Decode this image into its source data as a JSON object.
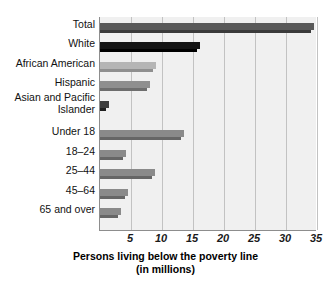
{
  "chart_data": {
    "type": "bar",
    "orientation": "horizontal",
    "title": "",
    "xlabel": "Persons living below the poverty line (in millions)",
    "ylabel": "",
    "xlim": [
      0,
      35
    ],
    "grid": true,
    "legend": false,
    "categories": [
      "Total",
      "White",
      "African American",
      "Hispanic",
      "Asian and Pacific Islander",
      "Under 18",
      "18–24",
      "25–44",
      "45–64",
      "65 and over"
    ],
    "values": [
      34.5,
      16.2,
      9.1,
      8.0,
      1.4,
      13.5,
      4.2,
      8.8,
      4.5,
      3.4
    ],
    "xticks": [
      5,
      10,
      15,
      20,
      25,
      30,
      35
    ],
    "xticklabels": [
      "5",
      "10",
      "15",
      "20",
      "25",
      "30",
      "35"
    ]
  },
  "axis_title": {
    "line1": "Persons living below the poverty line",
    "line2": "(in millions)"
  },
  "bars": [
    {
      "label": "Total",
      "value": 34.5,
      "fill": "#595959",
      "shadow": "#3a3a3a",
      "top": 6
    },
    {
      "label": "White",
      "value": 16.2,
      "fill": "#141414",
      "shadow": "#000000",
      "top": 25
    },
    {
      "label": "African American",
      "value": 9.1,
      "fill": "#b5b5b5",
      "shadow": "#8f8f8f",
      "top": 45
    },
    {
      "label": "Hispanic",
      "value": 8.0,
      "fill": "#8f8f8f",
      "shadow": "#6e6e6e",
      "top": 64
    },
    {
      "label": "Asian and Pacific\nIslander",
      "value": 1.4,
      "fill": "#3d3d3d",
      "shadow": "#1f1f1f",
      "top": 84
    },
    {
      "label": "Under 18",
      "value": 13.5,
      "fill": "#8a8a8a",
      "shadow": "#666666",
      "top": 113
    },
    {
      "label": "18–24",
      "value": 4.2,
      "fill": "#8a8a8a",
      "shadow": "#666666",
      "top": 133
    },
    {
      "label": "25–44",
      "value": 8.8,
      "fill": "#8a8a8a",
      "shadow": "#666666",
      "top": 152
    },
    {
      "label": "45–64",
      "value": 4.5,
      "fill": "#8a8a8a",
      "shadow": "#666666",
      "top": 172
    },
    {
      "label": "65 and over",
      "value": 3.4,
      "fill": "#8a8a8a",
      "shadow": "#666666",
      "top": 191
    }
  ],
  "ylabels": [
    {
      "text": "Total",
      "top": 2
    },
    {
      "text": "White",
      "top": 21
    },
    {
      "text": "African American",
      "top": 41
    },
    {
      "text": "Hispanic",
      "top": 60
    },
    {
      "text": "Asian and Pacific\nIslander",
      "top": 75
    },
    {
      "text": "Under 18",
      "top": 109
    },
    {
      "text": "18–24",
      "top": 129
    },
    {
      "text": "25–44",
      "top": 148
    },
    {
      "text": "45–64",
      "top": 168
    },
    {
      "text": "65 and over",
      "top": 187
    }
  ],
  "colors": {
    "plot_background": "#f0f0f0",
    "gridline": "#c2c2c2",
    "axis": "#8d8d8d",
    "text": "#111111"
  }
}
